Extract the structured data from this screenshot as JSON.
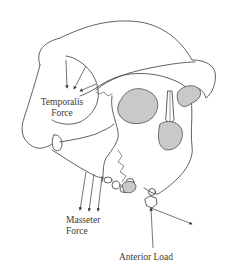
{
  "diagram": {
    "line_color": "#3a3a3a",
    "shading_color": "#c9c9c9",
    "background": "#ffffff",
    "labels": {
      "temporalis": {
        "line1": "Temporalis",
        "line2": "Force"
      },
      "masseter": {
        "line1": "Masseter",
        "line2": "Force"
      },
      "anterior_load": {
        "text": "Anterior Load"
      }
    },
    "arrows": {
      "temporalis_count": 3,
      "masseter_count": 3,
      "anterior_load_count": 2
    }
  }
}
